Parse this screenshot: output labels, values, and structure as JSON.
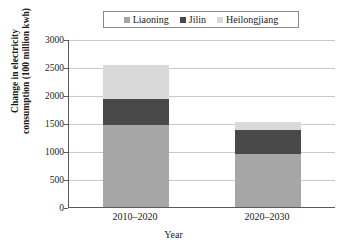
{
  "chart_data": {
    "type": "bar",
    "subtype": "stacked-bar",
    "title": "",
    "xlabel": "Year",
    "ylabel": "Change in electricity consumption (100 million kwh)",
    "ylabel_lines": [
      "Change in electricity",
      "consumption (100 million kwh)"
    ],
    "categories": [
      "2010–2020",
      "2020–2030"
    ],
    "series": [
      {
        "name": "Liaoning",
        "values": [
          1460,
          950
        ],
        "color": "#a6a6a6"
      },
      {
        "name": "Jilin",
        "values": [
          470,
          420
        ],
        "color": "#494949"
      },
      {
        "name": "Heilongjiang",
        "values": [
          600,
          140
        ],
        "color": "#d9d9d9"
      }
    ],
    "totals": [
      2530,
      1510
    ],
    "ylim": [
      0,
      3000
    ],
    "yticks": [
      0,
      500,
      1000,
      1500,
      2000,
      2500,
      3000
    ],
    "ytick_labels": [
      "0",
      "500",
      "1000",
      "1500",
      "2000",
      "2500",
      "3000"
    ],
    "grid": true,
    "legend_position": "top-center",
    "legend_boxed": true
  },
  "legend": {
    "entries": [
      {
        "label": "Liaoning",
        "color": "#a6a6a6"
      },
      {
        "label": "Jilin",
        "color": "#494949"
      },
      {
        "label": "Heilongjiang",
        "color": "#d9d9d9"
      }
    ]
  },
  "axes": {
    "x_title": "Year",
    "y_title_line1": "Change in electricity",
    "y_title_line2": "consumption (100 million kwh)",
    "x_categories": [
      "2010–2020",
      "2020–2030"
    ],
    "y_labels": [
      "3000",
      "2500",
      "2000",
      "1500",
      "1000",
      "500",
      "0"
    ]
  },
  "colors": {
    "liaoning": "#a6a6a6",
    "jilin": "#494949",
    "heilongjiang": "#d9d9d9",
    "gridline": "#c8c8c8",
    "axis": "#5a5a5a",
    "text": "#1a1a1a",
    "background": "#ffffff"
  }
}
